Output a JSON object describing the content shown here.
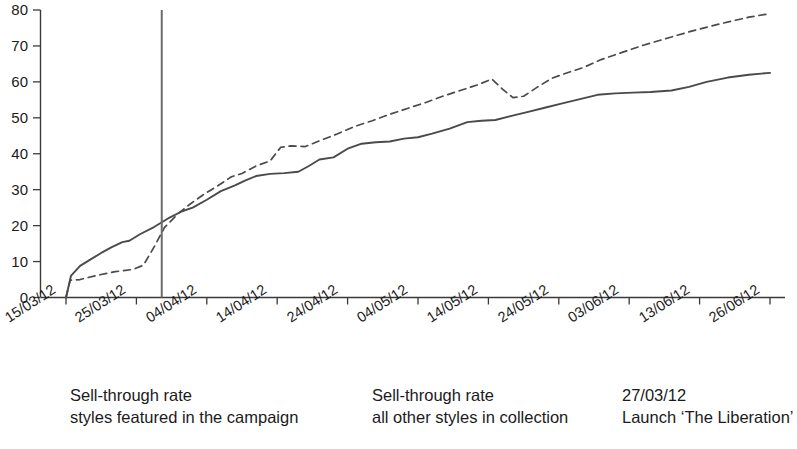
{
  "chart_data": {
    "type": "line",
    "title": "",
    "xlabel": "",
    "ylabel": "",
    "ylim": [
      0,
      80
    ],
    "yticks": [
      0,
      10,
      20,
      30,
      40,
      50,
      60,
      70,
      80
    ],
    "grid": false,
    "legend_position": "bottom",
    "x": [
      "15/03/12",
      "25/03/12",
      "04/04/12",
      "14/04/12",
      "24/04/12",
      "04/05/12",
      "14/05/12",
      "24/05/12",
      "03/06/12",
      "13/06/12",
      "26/06/12"
    ],
    "xticks": [
      "15/03/12",
      "25/03/12",
      "04/04/12",
      "14/04/12",
      "24/04/12",
      "04/05/12",
      "14/05/12",
      "24/05/12",
      "03/06/12",
      "13/06/12",
      "26/06/12"
    ],
    "series": [
      {
        "name": "Sell-through rate styles featured in the campaign",
        "style": "dashed",
        "color": "#4a4a4a",
        "points": [
          [
            0.0,
            0.0
          ],
          [
            0.06,
            4.8
          ],
          [
            0.2,
            5.0
          ],
          [
            0.45,
            6.2
          ],
          [
            0.7,
            7.2
          ],
          [
            0.95,
            7.8
          ],
          [
            1.1,
            9.0
          ],
          [
            1.25,
            14.0
          ],
          [
            1.4,
            19.5
          ],
          [
            1.6,
            23.5
          ],
          [
            1.75,
            25.8
          ],
          [
            1.95,
            28.6
          ],
          [
            2.15,
            31.0
          ],
          [
            2.35,
            33.6
          ],
          [
            2.5,
            34.5
          ],
          [
            2.7,
            36.6
          ],
          [
            2.9,
            38.0
          ],
          [
            3.05,
            41.8
          ],
          [
            3.2,
            42.2
          ],
          [
            3.4,
            42.0
          ],
          [
            3.6,
            43.6
          ],
          [
            3.85,
            45.5
          ],
          [
            4.1,
            47.6
          ],
          [
            4.35,
            49.2
          ],
          [
            4.6,
            51.0
          ],
          [
            4.85,
            52.6
          ],
          [
            5.1,
            54.2
          ],
          [
            5.35,
            56.0
          ],
          [
            5.6,
            57.6
          ],
          [
            5.85,
            59.2
          ],
          [
            6.05,
            60.8
          ],
          [
            6.2,
            58.0
          ],
          [
            6.35,
            55.6
          ],
          [
            6.5,
            56.0
          ],
          [
            6.7,
            58.6
          ],
          [
            6.9,
            61.0
          ],
          [
            7.1,
            62.4
          ],
          [
            7.35,
            64.0
          ],
          [
            7.6,
            66.2
          ],
          [
            7.9,
            68.2
          ],
          [
            8.2,
            70.2
          ],
          [
            8.55,
            72.2
          ],
          [
            8.9,
            74.2
          ],
          [
            9.3,
            76.2
          ],
          [
            9.7,
            78.0
          ],
          [
            10.0,
            79.0
          ]
        ]
      },
      {
        "name": "Sell-through rate all other styles in collection",
        "style": "solid",
        "color": "#4a4a4a",
        "points": [
          [
            0.0,
            0.0
          ],
          [
            0.07,
            6.0
          ],
          [
            0.2,
            8.8
          ],
          [
            0.35,
            10.6
          ],
          [
            0.5,
            12.4
          ],
          [
            0.65,
            14.0
          ],
          [
            0.8,
            15.4
          ],
          [
            0.9,
            15.8
          ],
          [
            1.05,
            17.6
          ],
          [
            1.25,
            19.6
          ],
          [
            1.45,
            22.0
          ],
          [
            1.65,
            24.0
          ],
          [
            1.8,
            25.0
          ],
          [
            2.0,
            27.2
          ],
          [
            2.2,
            29.6
          ],
          [
            2.4,
            31.2
          ],
          [
            2.55,
            32.6
          ],
          [
            2.7,
            33.8
          ],
          [
            2.9,
            34.4
          ],
          [
            3.1,
            34.6
          ],
          [
            3.3,
            35.0
          ],
          [
            3.45,
            36.6
          ],
          [
            3.6,
            38.4
          ],
          [
            3.8,
            39.0
          ],
          [
            4.0,
            41.4
          ],
          [
            4.2,
            42.8
          ],
          [
            4.4,
            43.2
          ],
          [
            4.6,
            43.4
          ],
          [
            4.8,
            44.2
          ],
          [
            5.0,
            44.6
          ],
          [
            5.2,
            45.6
          ],
          [
            5.45,
            47.0
          ],
          [
            5.7,
            48.8
          ],
          [
            5.9,
            49.2
          ],
          [
            6.1,
            49.4
          ],
          [
            6.3,
            50.4
          ],
          [
            6.55,
            51.6
          ],
          [
            6.8,
            52.8
          ],
          [
            7.05,
            54.0
          ],
          [
            7.3,
            55.2
          ],
          [
            7.55,
            56.4
          ],
          [
            7.8,
            56.8
          ],
          [
            8.05,
            57.0
          ],
          [
            8.3,
            57.2
          ],
          [
            8.6,
            57.6
          ],
          [
            8.85,
            58.6
          ],
          [
            9.1,
            60.0
          ],
          [
            9.4,
            61.2
          ],
          [
            9.7,
            62.0
          ],
          [
            10.0,
            62.5
          ]
        ]
      },
      {
        "name": "27/03/12 Launch 'The Liberation'",
        "style": "vertical-marker",
        "color": "#6b6b6b",
        "x_position": 1.36,
        "y_top": 80,
        "y_bottom": 0
      }
    ]
  },
  "legend": {
    "items": [
      {
        "id": "legend-campaign",
        "sample": "dashed",
        "line1": "Sell-through rate",
        "line2": "styles featured in the campaign"
      },
      {
        "id": "legend-other",
        "sample": "solid",
        "line1": "Sell-through rate",
        "line2": "all other styles in collection"
      },
      {
        "id": "legend-launch",
        "sample": "solid",
        "line1": "27/03/12",
        "line2": "Launch ‘The Liberation’"
      }
    ]
  },
  "colors": {
    "axis": "#3a3a3a",
    "line": "#4a4a4a",
    "marker": "#6b6b6b",
    "text": "#1b1b1b",
    "background": "#ffffff"
  }
}
